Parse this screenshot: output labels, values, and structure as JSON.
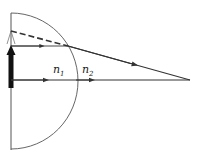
{
  "diagram": {
    "type": "optics-refraction",
    "labels": {
      "n1": {
        "base": "n",
        "sub": "1"
      },
      "n2": {
        "base": "n",
        "sub": "2"
      }
    },
    "colors": {
      "stroke": "#333333",
      "background": "#ffffff"
    }
  }
}
